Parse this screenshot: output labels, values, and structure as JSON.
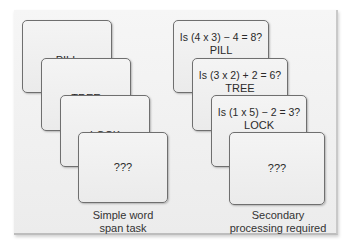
{
  "left_column": {
    "cards": [
      {
        "word": "PILL"
      },
      {
        "word": "TREE"
      },
      {
        "word": "LOCK"
      },
      {
        "word": "???"
      }
    ],
    "caption_line1": "Simple word",
    "caption_line2": "span task"
  },
  "right_column": {
    "cards": [
      {
        "question": "Is (4 x 3) − 4 = 8?",
        "word": "PILL"
      },
      {
        "question": "Is (3 x 2) + 2 = 6?",
        "word": "TREE"
      },
      {
        "question": "Is (1 x 5) − 2 = 3?",
        "word": "LOCK"
      },
      {
        "question": "",
        "word": "???"
      }
    ],
    "caption_line1": "Secondary",
    "caption_line2": "processing required"
  }
}
